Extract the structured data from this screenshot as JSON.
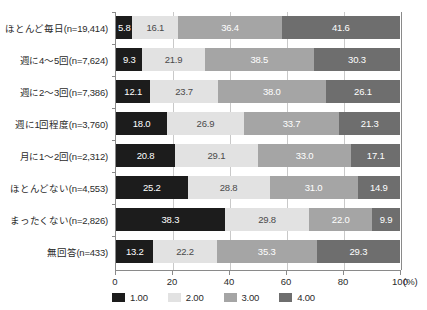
{
  "chart_data": {
    "type": "bar",
    "orientation": "horizontal",
    "stacked": true,
    "normalized": true,
    "title": "",
    "xlabel": "(%)",
    "ylabel": "",
    "xlim": [
      0,
      100
    ],
    "xticks": [
      0,
      20,
      40,
      60,
      80,
      100
    ],
    "xticklabels": [
      "0",
      "20",
      "40",
      "60",
      "80",
      "100"
    ],
    "grid": true,
    "grid_axis": "x",
    "legend_position": "bottom",
    "categories": [
      "ほとんど毎日(n=19,414)",
      "週に4〜5回(n=7,624)",
      "週に2〜3回(n=7,386)",
      "週に1回程度(n=3,760)",
      "月に1〜2回(n=2,312)",
      "ほとんどない(n=4,553)",
      "まったくない(n=2,826)",
      "無回答(n=433)"
    ],
    "series": [
      {
        "name": "1.00",
        "color": "#1c1c1c",
        "values": [
          5.8,
          9.3,
          12.1,
          18.0,
          20.8,
          25.2,
          38.3,
          13.2
        ],
        "labels": [
          "5.8",
          "9.3",
          "12.1",
          "18.0",
          "20.8",
          "25.2",
          "38.3",
          "13.2"
        ]
      },
      {
        "name": "2.00",
        "color": "#e2e2e2",
        "values": [
          16.1,
          21.9,
          23.7,
          26.9,
          29.1,
          28.8,
          29.8,
          22.2
        ],
        "labels": [
          "16.1",
          "21.9",
          "23.7",
          "26.9",
          "29.1",
          "28.8",
          "29.8",
          "22.2"
        ]
      },
      {
        "name": "3.00",
        "color": "#a5a5a5",
        "values": [
          36.4,
          38.5,
          38.0,
          33.7,
          33.0,
          31.0,
          22.0,
          35.3
        ],
        "labels": [
          "36.4",
          "38.5",
          "38.0",
          "33.7",
          "33.0",
          "31.0",
          "22.0",
          "35.3"
        ]
      },
      {
        "name": "4.00",
        "color": "#6e6e6e",
        "values": [
          41.6,
          30.3,
          26.1,
          21.3,
          17.1,
          14.9,
          9.9,
          29.3
        ],
        "labels": [
          "41.6",
          "30.3",
          "26.1",
          "21.3",
          "17.1",
          "14.9",
          "9.9",
          "29.3"
        ]
      }
    ]
  },
  "legend": {
    "items": [
      {
        "label": "1.00",
        "color": "#1c1c1c"
      },
      {
        "label": "2.00",
        "color": "#e2e2e2"
      },
      {
        "label": "3.00",
        "color": "#a5a5a5"
      },
      {
        "label": "4.00",
        "color": "#6e6e6e"
      }
    ]
  },
  "axis": {
    "x_unit": "(%)"
  }
}
